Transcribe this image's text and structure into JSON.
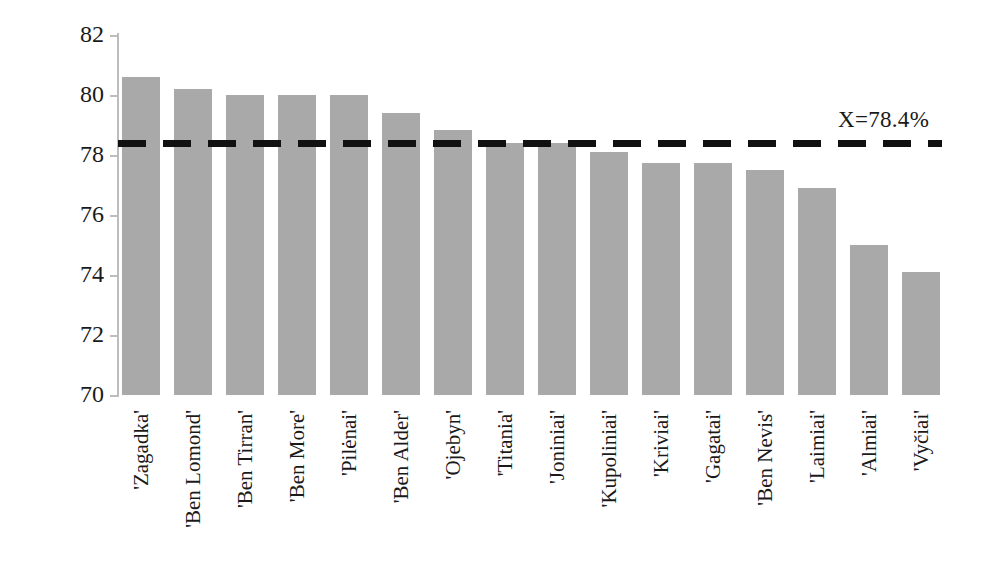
{
  "chart_data": {
    "type": "bar",
    "title": "",
    "xlabel": "",
    "ylabel": "RSA,%",
    "ylim": [
      70,
      82
    ],
    "yticks": [
      70,
      72,
      74,
      76,
      78,
      80,
      82
    ],
    "grid": false,
    "legend": "none",
    "categories": [
      "'Zagadka'",
      "'Ben Lomond'",
      "'Ben Tirran'",
      "'Ben More'",
      "'Pilėnai'",
      "'Ben Alder'",
      "'Ojebyn'",
      "'Titania'",
      "'Joniniai'",
      "'Kupoliniai'",
      "'Kriviai'",
      "'Gagatai'",
      "'Ben Nevis'",
      "'Laimiai'",
      "'Almiai'",
      "'Vyčiai'"
    ],
    "values": [
      80.6,
      80.2,
      80.0,
      80.0,
      80.0,
      79.4,
      78.85,
      78.4,
      78.4,
      78.1,
      77.75,
      77.75,
      77.5,
      76.9,
      75.0,
      74.1
    ],
    "annotations": [
      {
        "type": "reference-line",
        "label": "X=78.4%",
        "value": 78.4,
        "style": "dashed",
        "color": "#111111"
      }
    ],
    "bar_color": "#a9a9a9"
  },
  "axis": {
    "y_title": "RSA,%"
  }
}
